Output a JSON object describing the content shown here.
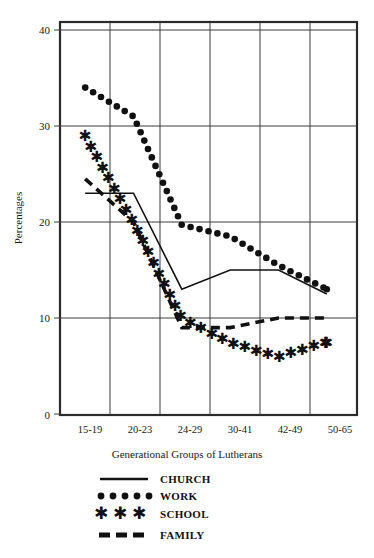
{
  "chart_data": {
    "type": "line",
    "title": "",
    "xlabel": "Generational Groups of Lutherans",
    "ylabel": "Percentages",
    "categories": [
      "15-19",
      "20-23",
      "24-29",
      "30-41",
      "42-49",
      "50-65"
    ],
    "ylim": [
      0,
      40
    ],
    "yticks": [
      0,
      10,
      20,
      30,
      40
    ],
    "grid": true,
    "legend_position": "below",
    "series": [
      {
        "name": "CHURCH",
        "marker": "solid-line",
        "values": [
          23,
          23,
          13,
          15,
          15,
          12.5
        ]
      },
      {
        "name": "WORK",
        "marker": "dotted",
        "values": [
          34,
          31,
          19.7,
          18.5,
          15.5,
          13
        ]
      },
      {
        "name": "SCHOOL",
        "marker": "stars",
        "values": [
          29,
          20,
          10,
          7.5,
          6,
          7.5
        ]
      },
      {
        "name": "FAMILY",
        "marker": "dashed",
        "values": [
          24.5,
          20,
          9,
          9,
          10,
          10
        ]
      }
    ]
  },
  "axis": {
    "y_tick_labels": [
      "40",
      "30",
      "20",
      "10",
      "0"
    ],
    "y_title": "Percentages",
    "x_title": "Generational Groups of Lutherans",
    "x_tick_labels": [
      "15-19",
      "20-23",
      "24-29",
      "30-41",
      "42-49",
      "50-65"
    ]
  },
  "legend": {
    "entries": [
      {
        "label": "CHURCH",
        "style": "solid-line"
      },
      {
        "label": "WORK",
        "style": "dotted"
      },
      {
        "label": "SCHOOL",
        "style": "stars"
      },
      {
        "label": "FAMILY",
        "style": "dashed"
      }
    ]
  },
  "colors": {
    "ink": "#111111",
    "grid": "#3a3a3a",
    "background": "#ffffff"
  }
}
